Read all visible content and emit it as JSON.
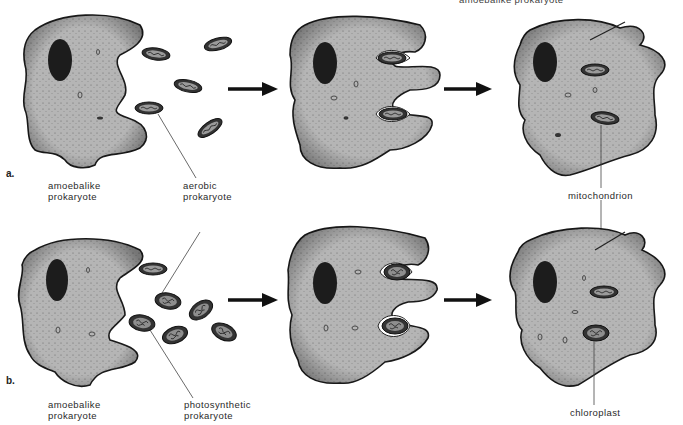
{
  "title_cut": "amoebalike prokaryote",
  "panels": [
    {
      "letter": "a.",
      "labels": {
        "host": [
          "amoebalike",
          "prokaryote"
        ],
        "symbiont": [
          "aerobic",
          "prokaryote"
        ],
        "result": "mitochondrion"
      }
    },
    {
      "letter": "b.",
      "labels": {
        "host": [
          "amoebalike",
          "prokaryote"
        ],
        "symbiont": [
          "photosynthetic",
          "prokaryote"
        ],
        "result": "chloroplast"
      }
    }
  ],
  "colors": {
    "cytoplasm": "#b3b3b3",
    "outline": "#1a1a1a",
    "nucleus": "#1c1c1c",
    "organelle": "#3a3a3a",
    "arrow": "#111111",
    "leader_line": "#444444"
  }
}
